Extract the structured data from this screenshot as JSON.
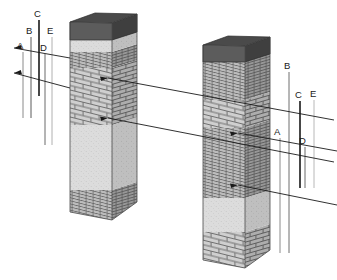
{
  "diagram": {
    "background_color": "#ffffff",
    "line_color": "#1a1a1a",
    "faint_line_color": "#b3b3b3",
    "cap_top_color": "#4a4a4a",
    "cap_side_color": "#6e6e6e",
    "stone_color": "#d8d8d8",
    "brick_color": "#cccccc",
    "mortar_color": "#7a7a7a",
    "shadow_color": "#9a9a9a"
  },
  "left_column": {
    "name": "left-column",
    "caption": "",
    "bands": [
      {
        "id": "cap",
        "label": "cap",
        "texture": "solid-dark"
      },
      {
        "id": "stone-upper",
        "label": "stone band",
        "texture": "stipple"
      },
      {
        "id": "thin-brick-upper",
        "label": "thin brick course",
        "texture": "thin-brick"
      },
      {
        "id": "brick-main",
        "label": "brick course",
        "texture": "large-brick"
      },
      {
        "id": "stone-lower",
        "label": "stone shaft",
        "texture": "stipple"
      },
      {
        "id": "thin-brick-base",
        "label": "thin brick base",
        "texture": "thin-brick"
      }
    ]
  },
  "right_column": {
    "name": "right-column",
    "caption": "",
    "bands": [
      {
        "id": "cap",
        "label": "cap",
        "texture": "solid-dark"
      },
      {
        "id": "thin-brick-upper",
        "label": "thin brick course",
        "texture": "thin-brick"
      },
      {
        "id": "brick-band",
        "label": "brick course",
        "texture": "large-brick"
      },
      {
        "id": "thin-brick-main",
        "label": "thin brick shaft",
        "texture": "thin-brick"
      },
      {
        "id": "stone-lower",
        "label": "stone band",
        "texture": "stipple"
      },
      {
        "id": "brick-base",
        "label": "brick base",
        "texture": "large-brick"
      }
    ]
  },
  "left_labels": [
    {
      "id": "A",
      "text": "A",
      "x": 20,
      "y": 46
    },
    {
      "id": "B",
      "text": "B",
      "x": 29,
      "y": 31
    },
    {
      "id": "C",
      "text": "C",
      "x": 37,
      "y": 14
    },
    {
      "id": "D",
      "text": "D",
      "x": 42,
      "y": 48
    },
    {
      "id": "E",
      "text": "E",
      "x": 50,
      "y": 31
    }
  ],
  "right_labels": [
    {
      "id": "A",
      "text": "A",
      "x": 277,
      "y": 132
    },
    {
      "id": "B",
      "text": "B",
      "x": 287,
      "y": 66
    },
    {
      "id": "C",
      "text": "C",
      "x": 298,
      "y": 95
    },
    {
      "id": "D",
      "text": "D",
      "x": 300,
      "y": 141
    },
    {
      "id": "E",
      "text": "E",
      "x": 312,
      "y": 94
    }
  ],
  "leader_lines": [
    {
      "id": "left-upper",
      "from": "left-column",
      "to": "left-labels"
    },
    {
      "id": "left-lower",
      "from": "left-column",
      "to": "left-labels"
    },
    {
      "id": "cross-upper",
      "from": "left-column",
      "to": "right-labels"
    },
    {
      "id": "cross-lower",
      "from": "left-column",
      "to": "right-labels"
    },
    {
      "id": "right-upper",
      "from": "right-column",
      "to": "right-labels"
    },
    {
      "id": "right-lower",
      "from": "right-column",
      "to": "right-labels"
    }
  ]
}
